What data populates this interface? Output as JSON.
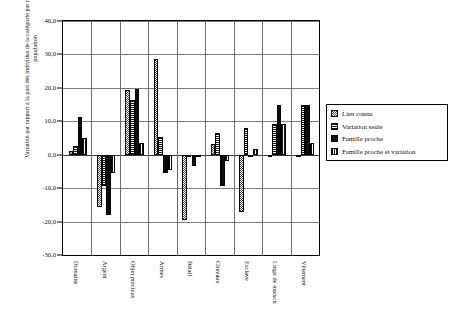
{
  "chart_data": {
    "type": "bar",
    "title": "",
    "xlabel": "",
    "ylabel": "Variation par rapport à la part des individus de la catégorie par rapport à l'ensemble de la population",
    "ylim": [
      -30.0,
      40.0
    ],
    "ytick_step": 10.0,
    "ytick_labels": [
      "40,0",
      "30,0",
      "20,0",
      "10,0",
      "0,0",
      "-10,0",
      "-20,0",
      "-30,0"
    ],
    "ytick_values": [
      40.0,
      30.0,
      20.0,
      10.0,
      0.0,
      -10.0,
      -20.0,
      -30.0
    ],
    "grid": true,
    "legend_position": "right",
    "categories": [
      "Domaine",
      "Argent",
      "Objet précieux",
      "Armes",
      "Bétail",
      "Chevaux",
      "Esclave",
      "Linge de maison",
      "Vêtement"
    ],
    "series": [
      {
        "name": "Lien connu",
        "pattern": "dotted",
        "color": "#4a4a4a",
        "values": [
          1.0,
          -15.5,
          19.3,
          28.5,
          -19.5,
          3.3,
          -17.0,
          -0.5,
          -0.5
        ]
      },
      {
        "name": "Variation seule",
        "pattern": "horizontal-lines",
        "color": "#111111",
        "values": [
          2.5,
          -9.5,
          16.5,
          5.3,
          0.0,
          6.5,
          8.0,
          9.3,
          15.0
        ]
      },
      {
        "name": "Famille proche",
        "pattern": "solid",
        "color": "#0d0d0d",
        "values": [
          11.3,
          -18.0,
          19.8,
          -5.5,
          -3.5,
          -9.5,
          0.0,
          15.0,
          15.0
        ]
      },
      {
        "name": "Famille proche et variation",
        "pattern": "vertical-lines",
        "color": "#111111",
        "values": [
          5.0,
          -5.5,
          3.4,
          -4.5,
          0.0,
          -2.0,
          1.7,
          9.2,
          3.5
        ]
      }
    ]
  },
  "legend": {
    "items": [
      {
        "label": "Lien connu",
        "pattern": "dotted"
      },
      {
        "label": "Variation seule",
        "pattern": "horizontal-lines"
      },
      {
        "label": "Famille proche",
        "pattern": "solid"
      },
      {
        "label": "Famille proche et variation",
        "pattern": "vertical-lines"
      }
    ]
  }
}
